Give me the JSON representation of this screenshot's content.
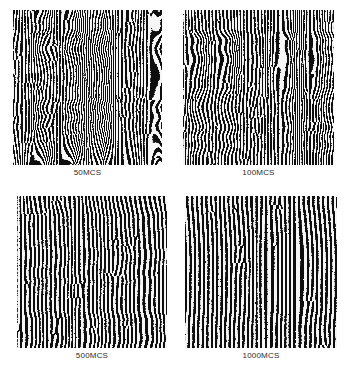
{
  "figure": {
    "name": "monte-carlo-stripe-pattern-evolution",
    "background_color": "#ffffff",
    "label_color": "#2b2b2b",
    "columns": 2,
    "rows": 2
  },
  "chart_data": {
    "type": "heatmap",
    "title": "",
    "subtitle": "",
    "xlabel": "",
    "ylabel": "",
    "grid": false,
    "legend": "none",
    "colormap": [
      "#000000",
      "#ffffff"
    ],
    "panels": [
      {
        "id": "panel-50mcs",
        "label": "50MCS",
        "time_steps": 50,
        "time_unit": "MCS",
        "row": 0,
        "col": 0,
        "x": 13,
        "y": 10,
        "width": 149,
        "height": 155,
        "stripe_period_px": 3.0,
        "waviness": 1.0,
        "defect_density": 1.0,
        "seed": 11
      },
      {
        "id": "panel-100mcs",
        "label": "100MCS",
        "time_steps": 100,
        "time_unit": "MCS",
        "row": 0,
        "col": 1,
        "x": 183,
        "y": 10,
        "width": 151,
        "height": 155,
        "stripe_period_px": 3.3,
        "waviness": 0.82,
        "defect_density": 0.78,
        "seed": 27
      },
      {
        "id": "panel-500mcs",
        "label": "500MCS",
        "time_steps": 500,
        "time_unit": "MCS",
        "row": 1,
        "col": 0,
        "x": 17,
        "y": 196,
        "width": 150,
        "height": 152,
        "stripe_period_px": 4.2,
        "waviness": 0.42,
        "defect_density": 0.34,
        "seed": 43
      },
      {
        "id": "panel-1000mcs",
        "label": "1000MCS",
        "time_steps": 1000,
        "time_unit": "MCS",
        "row": 1,
        "col": 1,
        "x": 185,
        "y": 196,
        "width": 152,
        "height": 152,
        "stripe_period_px": 4.6,
        "waviness": 0.26,
        "defect_density": 0.2,
        "seed": 61
      }
    ],
    "series": [
      {
        "name": "Monte Carlo steps",
        "values": [
          50,
          100,
          500,
          1000
        ]
      },
      {
        "name": "Stripe period (px)",
        "values": [
          3.0,
          3.3,
          4.2,
          4.6
        ]
      }
    ],
    "categories": [
      "50MCS",
      "100MCS",
      "500MCS",
      "1000MCS"
    ]
  }
}
